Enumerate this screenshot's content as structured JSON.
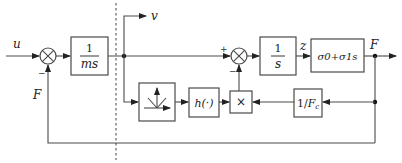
{
  "diagram": {
    "type": "control block diagram",
    "signals": {
      "input": "u",
      "velocity": "v",
      "state": "z",
      "friction_output": "F",
      "feedback": "F"
    },
    "blocks": {
      "plant": {
        "numerator": "1",
        "denominator": "ms"
      },
      "integrator": {
        "numerator": "1",
        "denominator": "s"
      },
      "friction_gain": "σ0+σ1s",
      "sign_switch": "sign-function-icon",
      "h_function": "h(·)",
      "multiplier": "×",
      "inverse_fc": "1/Fc"
    },
    "sums": {
      "sum1": {
        "signs": [
          "+",
          "−"
        ]
      },
      "sum2": {
        "signs": [
          "+",
          "−"
        ]
      }
    },
    "sign_labels": {
      "sum1_minus": "−",
      "sum2_plus": "+",
      "sum2_minus": "−"
    }
  }
}
